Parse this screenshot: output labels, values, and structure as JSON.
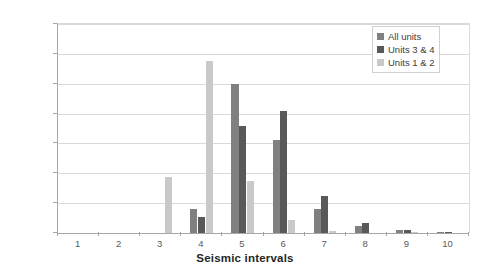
{
  "chart_data": {
    "type": "bar",
    "title": "",
    "xlabel": "Seismic intervals",
    "ylabel": "",
    "categories": [
      "1",
      "2",
      "3",
      "4",
      "5",
      "6",
      "7",
      "8",
      "9",
      "10"
    ],
    "ylim": [
      0,
      70
    ],
    "ytick_labels": [
      "0.0%",
      "10.0%",
      "20.0%",
      "30.0%",
      "40.0%",
      "50.0%",
      "60.0%",
      "70.0%"
    ],
    "ytick_values": [
      0,
      10,
      20,
      30,
      40,
      50,
      60,
      70
    ],
    "grid": true,
    "legend_position": "top-right",
    "series": [
      {
        "name": "All units",
        "color": "#808080",
        "values": [
          0,
          0,
          0,
          8.0,
          50.0,
          31.0,
          8.0,
          2.3,
          1.0,
          0.2
        ]
      },
      {
        "name": "Units 3 & 4",
        "color": "#595959",
        "values": [
          0,
          0,
          0,
          5.5,
          36.0,
          41.0,
          12.5,
          3.3,
          1.0,
          0.3
        ]
      },
      {
        "name": "Units 1 & 2",
        "color": "#c9c9c9",
        "values": [
          0,
          0,
          18.8,
          57.5,
          17.5,
          4.5,
          0.7,
          0,
          0.3,
          0
        ]
      }
    ]
  },
  "colors": {
    "axis": "#a6a6a6",
    "gridline": "#d9d9d9",
    "tick_text": "#595959",
    "title_text": "#262626",
    "background": "#ffffff"
  }
}
